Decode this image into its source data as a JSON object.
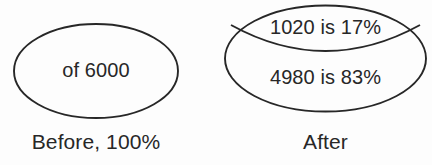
{
  "diagram": {
    "type": "before-after-proportion-ellipses",
    "line_color": "#272727",
    "background_color": "#fdfdfd",
    "groups": [
      {
        "name": "before",
        "shape": "ellipse",
        "inner_label": "of 6000",
        "caption": "Before, 100%",
        "total": 6000,
        "percent": 100
      },
      {
        "name": "after",
        "shape": "ellipse-split-by-arc",
        "caption": "After",
        "segments": [
          {
            "name": "top-segment",
            "label": "1020 is 17%",
            "value": 1020,
            "percent": 17
          },
          {
            "name": "bottom-segment",
            "label": "4980 is 83%",
            "value": 4980,
            "percent": 83
          }
        ]
      }
    ]
  }
}
